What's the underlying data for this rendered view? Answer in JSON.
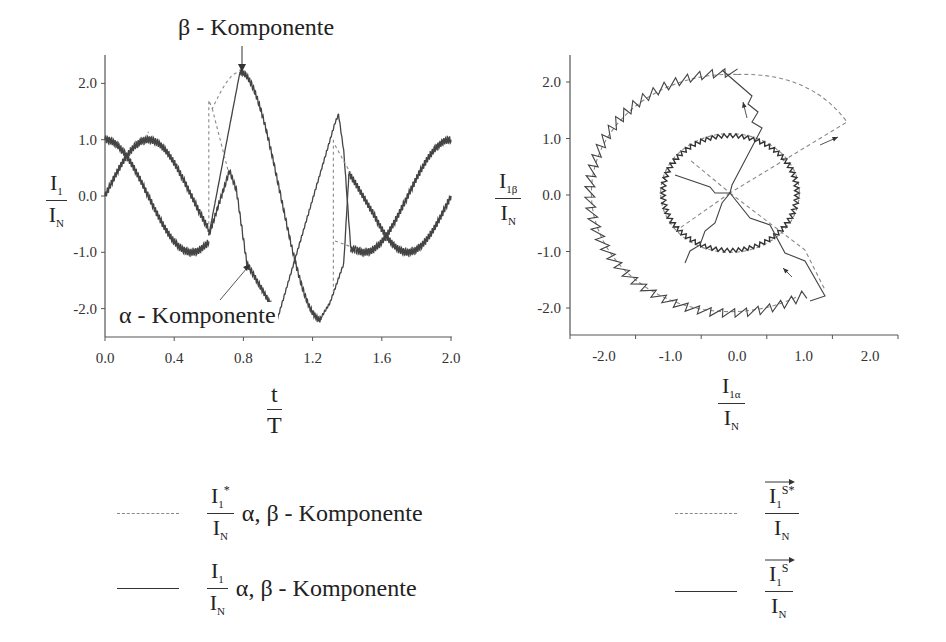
{
  "left_chart": {
    "top_label": "β - Komponente",
    "bottom_label": "α - Komponente",
    "ylabel": {
      "num": "I",
      "num_sub": "1",
      "den": "I",
      "den_sub": "N"
    },
    "xlabel": {
      "num": "t",
      "den": "T"
    },
    "y_ticks": [
      "2.0",
      "1.0",
      "0.0",
      "-1.0",
      "-2.0"
    ],
    "x_ticks": [
      "0.0",
      "0.4",
      "0.8",
      "1.2",
      "1.6",
      "2.0"
    ]
  },
  "right_chart": {
    "ylabel": {
      "num": "I",
      "num_sub": "1β",
      "den": "I",
      "den_sub": "N"
    },
    "xlabel": {
      "num": "I",
      "num_sub": "1α",
      "den": "I",
      "den_sub": "N"
    },
    "y_ticks": [
      "2.0",
      "1.0",
      "0.0",
      "-1.0",
      "-2.0"
    ],
    "x_ticks": [
      "-2.0",
      "-1.0",
      "0.0",
      "1.0",
      "2.0"
    ]
  },
  "legend": {
    "left": [
      {
        "style": "dashed",
        "num": "I",
        "num_sub": "1",
        "num_sup": "*",
        "den": "I",
        "den_sub": "N",
        "text": "α, β - Komponente"
      },
      {
        "style": "solid",
        "num": "I",
        "num_sub": "1",
        "num_sup": "",
        "den": "I",
        "den_sub": "N",
        "text": "α, β - Komponente"
      }
    ],
    "right": [
      {
        "style": "dashed",
        "num": "I",
        "num_sub": "1",
        "num_sup": "S*",
        "den": "I",
        "den_sub": "N"
      },
      {
        "style": "solid",
        "num": "I",
        "num_sub": "1",
        "num_sup": "S",
        "den": "I",
        "den_sub": "N"
      }
    ]
  },
  "chart_data": [
    {
      "type": "line",
      "title": "",
      "xlabel": "t / T",
      "ylabel": "I1 / IN",
      "xlim": [
        0.0,
        2.0
      ],
      "ylim": [
        -2.5,
        2.5
      ],
      "grid": false,
      "annotations": [
        "β - Komponente",
        "α - Komponente"
      ],
      "series": [
        {
          "name": "I1/IN α-Komponente (actual)",
          "style": "solid",
          "x": [
            0.0,
            0.25,
            0.5,
            0.6,
            0.72,
            0.82,
            1.0,
            1.35,
            1.42,
            1.5,
            1.75,
            2.0
          ],
          "values": [
            1.0,
            0.0,
            -1.0,
            -0.7,
            0.45,
            -1.2,
            -2.15,
            1.45,
            -0.9,
            -1.0,
            0.0,
            1.0
          ]
        },
        {
          "name": "I1/IN β-Komponente (actual)",
          "style": "solid",
          "x": [
            0.0,
            0.25,
            0.5,
            0.6,
            0.78,
            1.0,
            1.25,
            1.35,
            1.42,
            1.75,
            2.0
          ],
          "values": [
            0.0,
            1.0,
            0.0,
            -0.7,
            2.2,
            -0.4,
            -2.15,
            -1.7,
            0.4,
            -1.0,
            0.0
          ]
        },
        {
          "name": "I1*/IN α,β-Komponente (reference)",
          "style": "dashed",
          "x": [
            0.6,
            0.6,
            0.62,
            0.78,
            1.0,
            1.33,
            1.33,
            1.42
          ],
          "values": [
            -0.5,
            1.7,
            1.5,
            2.2,
            0.0,
            1.2,
            -1.7,
            -0.9
          ]
        }
      ]
    },
    {
      "type": "scatter",
      "title": "",
      "xlabel": "I1α / IN",
      "ylabel": "I1β / IN",
      "xlim": [
        -2.5,
        2.5
      ],
      "ylim": [
        -2.5,
        2.5
      ],
      "grid": false,
      "series": [
        {
          "name": "I1S*/IN (reference vector locus)",
          "style": "dashed",
          "description": "inner circle radius ~1.0 centered at origin, outer arc radius ~2.1, radial dashed transitions"
        },
        {
          "name": "I1S/IN (actual vector locus)",
          "style": "solid",
          "description": "sawtooth circle radius ~1.0 and ~2.1, with stepped radial transitions"
        }
      ]
    }
  ]
}
